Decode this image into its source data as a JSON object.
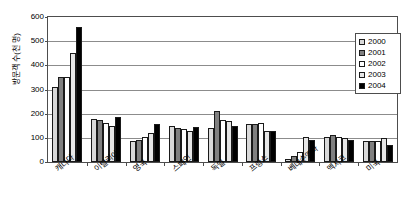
{
  "chart_data": {
    "type": "bar",
    "title": "",
    "xlabel": "",
    "ylabel": "방문객 수(천 명)",
    "ylim": [
      0,
      600
    ],
    "ytick_values": [
      0,
      100,
      200,
      300,
      400,
      500,
      600
    ],
    "ytick_labels": [
      "0",
      "100",
      "200",
      "300",
      "400",
      "500",
      "600"
    ],
    "grid": true,
    "legend_position": "top-right",
    "categories": [
      "캐나다",
      "이탈리아",
      "영국",
      "스페인",
      "독일",
      "프랑스",
      "베네수엘라",
      "멕시코",
      "미국"
    ],
    "series": [
      {
        "name": "2000",
        "color": "#d9d9d9",
        "values": [
          310,
          180,
          88,
          148,
          140,
          158,
          12,
          105,
          85
        ]
      },
      {
        "name": "2001",
        "color": "#808080",
        "values": [
          350,
          175,
          93,
          140,
          210,
          158,
          25,
          110,
          85
        ]
      },
      {
        "name": "2002",
        "color": "#ffffff",
        "values": [
          350,
          162,
          103,
          138,
          175,
          162,
          40,
          103,
          85
        ]
      },
      {
        "name": "2003",
        "color": "#e6e6e6",
        "values": [
          450,
          150,
          120,
          128,
          168,
          130,
          105,
          100,
          100
        ]
      },
      {
        "name": "2004",
        "color": "#000000",
        "values": [
          560,
          185,
          158,
          145,
          150,
          128,
          90,
          92,
          70
        ]
      }
    ]
  },
  "legend": {
    "entries": [
      {
        "label": "2000"
      },
      {
        "label": "2001"
      },
      {
        "label": "2002"
      },
      {
        "label": "2003"
      },
      {
        "label": "2004"
      }
    ]
  },
  "axis": {
    "y_title": "방문객 수(천 명)"
  }
}
